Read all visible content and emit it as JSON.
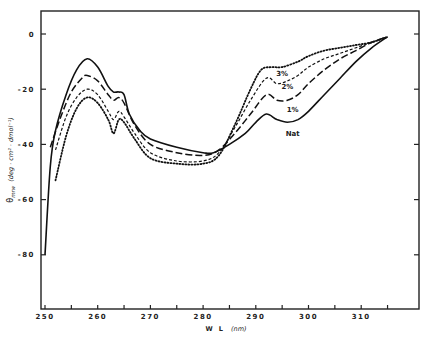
{
  "chart_data": {
    "type": "line",
    "title": "",
    "xlabel": "W L (nm)",
    "ylabel": "θ_mrw (deg·cm²·dmol⁻¹)",
    "xlim": [
      249,
      318
    ],
    "ylim": [
      -100,
      8
    ],
    "x_ticks": [
      250,
      260,
      270,
      280,
      290,
      300,
      310
    ],
    "x_minor_ticks": [
      255,
      265,
      275,
      285,
      295,
      305,
      315
    ],
    "y_ticks": [
      0,
      -20,
      -40,
      -60,
      -80
    ],
    "y_tick_labels": [
      "0",
      "-20",
      "-40",
      "-60",
      "-80"
    ],
    "grid": false,
    "legend": "inline labels near curves at ~292–296 nm",
    "series": [
      {
        "name": "Nat",
        "style": "solid",
        "x": [
          250,
          251,
          252,
          254,
          256,
          258,
          260,
          262,
          263,
          264,
          265,
          266,
          268,
          270,
          275,
          280,
          282,
          285,
          288,
          290,
          292,
          294,
          296,
          298,
          300,
          303,
          306,
          309,
          312,
          315
        ],
        "y": [
          -80,
          -48,
          -35,
          -22,
          -13,
          -9,
          -12,
          -19,
          -21,
          -21,
          -22,
          -29,
          -35,
          -38,
          -41,
          -43,
          -43,
          -40,
          -36,
          -32,
          -29,
          -31,
          -32,
          -31,
          -28,
          -22,
          -16,
          -10,
          -5,
          -1
        ]
      },
      {
        "name": "1%",
        "style": "long-dash",
        "x": [
          251,
          253,
          255,
          257,
          258,
          260,
          262,
          263,
          264,
          265,
          267,
          270,
          275,
          280,
          283,
          286,
          289,
          292,
          294,
          296,
          298,
          300,
          303,
          306,
          309,
          312,
          315
        ],
        "y": [
          -41,
          -30,
          -21,
          -16,
          -15,
          -17,
          -22,
          -24,
          -23,
          -25,
          -33,
          -40,
          -43,
          -44,
          -42,
          -36,
          -29,
          -22,
          -24,
          -24,
          -22,
          -18,
          -13,
          -9,
          -6,
          -3,
          -1
        ]
      },
      {
        "name": "2%",
        "style": "short-dash",
        "x": [
          252,
          254,
          256,
          258,
          260,
          262,
          263,
          264,
          265,
          267,
          270,
          275,
          280,
          283,
          286,
          289,
          292,
          294,
          296,
          298,
          300,
          303,
          306,
          309,
          312,
          315
        ],
        "y": [
          -42,
          -30,
          -23,
          -20,
          -22,
          -28,
          -31,
          -28,
          -30,
          -36,
          -43,
          -46,
          -46,
          -43,
          -34,
          -24,
          -16,
          -18,
          -17,
          -15,
          -12,
          -9,
          -7,
          -5,
          -3,
          -1
        ]
      },
      {
        "name": "3%",
        "style": "dotted",
        "x": [
          252,
          254,
          256,
          258,
          260,
          262,
          263,
          264,
          265,
          267,
          270,
          275,
          280,
          283,
          286,
          289,
          291,
          293,
          295,
          298,
          300,
          303,
          306,
          309,
          312,
          315
        ],
        "y": [
          -53,
          -37,
          -27,
          -23,
          -25,
          -31,
          -36,
          -31,
          -32,
          -38,
          -45,
          -47,
          -47,
          -44,
          -33,
          -20,
          -13,
          -12,
          -12,
          -10,
          -8,
          -6,
          -5,
          -4,
          -3,
          -1
        ]
      }
    ],
    "annotations": [
      {
        "text": "3%",
        "x": 295,
        "y": -14
      },
      {
        "text": "2%",
        "x": 296,
        "y": -19
      },
      {
        "text": "1%",
        "x": 297,
        "y": -27
      },
      {
        "text": "Nat",
        "x": 297,
        "y": -36
      }
    ]
  },
  "labels": {
    "xlabel_main": "W L",
    "xlabel_unit": "(nm)",
    "ylabel_main": "θ",
    "ylabel_sub": "mrw",
    "ylabel_unit": "(deg · cm² · dmol⁻¹)"
  }
}
